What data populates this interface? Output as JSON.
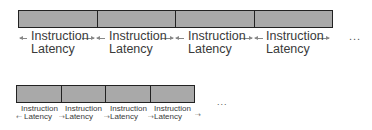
{
  "top_row": {
    "segments": 4,
    "labels": [
      {
        "line1": "Instruction",
        "line2": "Latency"
      },
      {
        "line1": "Instruction",
        "line2": "Latency"
      },
      {
        "line1": "Instruction",
        "line2": "Latency"
      },
      {
        "line1": "Instruction",
        "line2": "Latency"
      }
    ],
    "ellipsis": "..."
  },
  "bottom_row": {
    "segments": 4,
    "labels": [
      {
        "line1": "Instruction",
        "line2": "Latency"
      },
      {
        "line1": "Instruction",
        "line2": "Latency"
      },
      {
        "line1": "Instruction",
        "line2": "Latency"
      },
      {
        "line1": "Instruction",
        "line2": "Latency"
      }
    ],
    "ellipsis": "..."
  },
  "colors": {
    "segment_fill": "#a9a9a9",
    "segment_border": "#222222",
    "arrow": "#888888",
    "text": "#3a3a3a"
  }
}
